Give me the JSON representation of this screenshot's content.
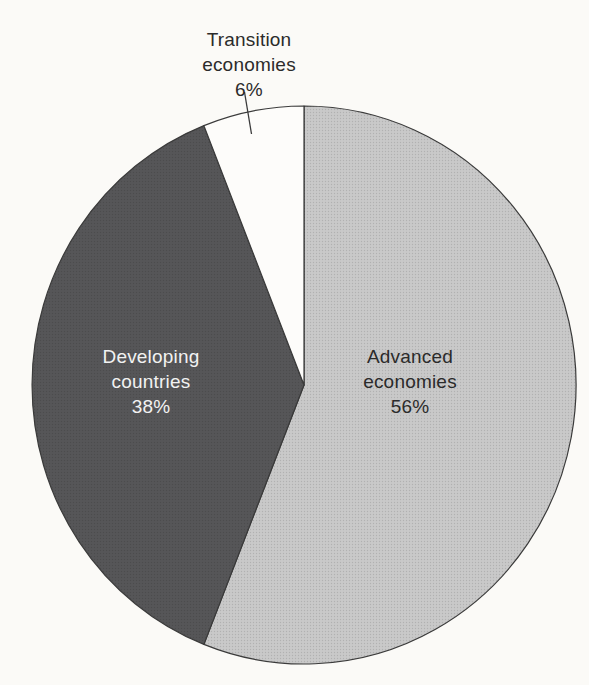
{
  "figure": {
    "background_color": "#fbfaf7",
    "outline_color": "#3b3b3b"
  },
  "chart_data": {
    "type": "pie",
    "title": "",
    "start_angle_deg": 0,
    "direction": "clockwise",
    "legend_position": "none",
    "slices": [
      {
        "label": "Advanced economies",
        "label_lines": [
          "Advanced",
          "economies"
        ],
        "value": 56,
        "pct_label": "56%",
        "color": "#c9c9c9",
        "text_color": "#2b2b2b"
      },
      {
        "label": "Developing countries",
        "label_lines": [
          "Developing",
          "countries"
        ],
        "value": 38,
        "pct_label": "38%",
        "color": "#565658",
        "text_color": "#f2f2f2"
      },
      {
        "label": "Transition economies",
        "label_lines": [
          "Transition",
          "economies"
        ],
        "value": 6,
        "pct_label": "6%",
        "color": "#fdfcfa",
        "text_color": "#2b2b2b"
      }
    ]
  }
}
